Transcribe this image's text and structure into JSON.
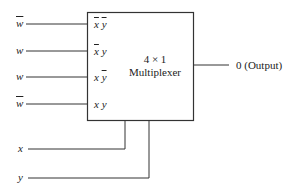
{
  "diagram": {
    "block": {
      "line1": "4 × 1",
      "line2": "Multiplexer"
    },
    "data_inputs": [
      {
        "signal": "w",
        "complemented": true,
        "select_code": [
          {
            "v": "x",
            "bar": true
          },
          {
            "v": "y",
            "bar": true
          }
        ]
      },
      {
        "signal": "w",
        "complemented": false,
        "select_code": [
          {
            "v": "x",
            "bar": true
          },
          {
            "v": "y",
            "bar": false
          }
        ]
      },
      {
        "signal": "w",
        "complemented": false,
        "select_code": [
          {
            "v": "x",
            "bar": false
          },
          {
            "v": "y",
            "bar": true
          }
        ]
      },
      {
        "signal": "w",
        "complemented": true,
        "select_code": [
          {
            "v": "x",
            "bar": false
          },
          {
            "v": "y",
            "bar": false
          }
        ]
      }
    ],
    "select_inputs": [
      {
        "label": "x"
      },
      {
        "label": "y"
      }
    ],
    "output": {
      "label": "0 (Output)"
    },
    "colors": {
      "line": "#333333",
      "text": "#222222",
      "background": "#ffffff"
    }
  }
}
